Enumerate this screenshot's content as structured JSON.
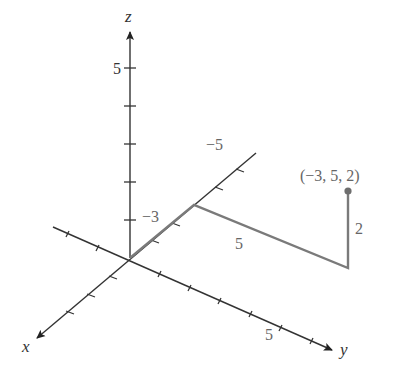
{
  "diagram": {
    "type": "3d-coordinate-system",
    "axes": {
      "x": {
        "label": "x"
      },
      "y": {
        "label": "y"
      },
      "z": {
        "label": "z"
      }
    },
    "tick_labels": {
      "z_five": "5",
      "x_neg_five": "−5",
      "y_five": "5"
    },
    "path": {
      "segments": [
        {
          "axis": "x",
          "length_label": "−3",
          "from": [
            0,
            0,
            0
          ],
          "to": [
            -3,
            0,
            0
          ]
        },
        {
          "axis": "y",
          "length_label": "5",
          "from": [
            -3,
            0,
            0
          ],
          "to": [
            -3,
            5,
            0
          ]
        },
        {
          "axis": "z",
          "length_label": "2",
          "from": [
            -3,
            5,
            0
          ],
          "to": [
            -3,
            5,
            2
          ]
        }
      ]
    },
    "point": {
      "coords": [
        -3,
        5,
        2
      ],
      "label": "(−3, 5, 2)"
    },
    "colors": {
      "axis": "#333333",
      "path": "#7a7a7a",
      "point": "#6e6e6e",
      "path_label": "#666666"
    }
  }
}
